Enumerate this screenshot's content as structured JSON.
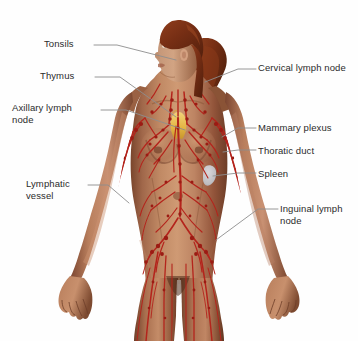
{
  "figure": {
    "background_color": "#fefefe",
    "width": 358,
    "height": 341
  },
  "palette": {
    "lymph_vessel": "#b4241c",
    "lymph_node": "#a01c14",
    "skin_light": "#c79madeup",
    "skin_mid": "#a9leavemadeup",
    "leader_line": "#8a8a8a",
    "label_text": "#2b2b2b",
    "hair": "#7d3218",
    "thymus": "#e0b23c",
    "spleen": "#c9ccd2"
  },
  "colors": {
    "lymph_vessel": "#b4241c",
    "lymph_node": "#991a12",
    "leader_line": "#8d8d8d",
    "label_text": "#2b2b2b",
    "hair_dark": "#6e2a14",
    "hair_mid": "#8a3a1c",
    "hair_light": "#a04a22",
    "skin_highlight": "#d8a88a",
    "skin_base": "#bd8463",
    "skin_mid": "#a96c4c",
    "skin_shadow": "#7d4a30",
    "skin_deep": "#5d3220",
    "thymus": "#e8bc4e",
    "spleen": "#c6c9d0",
    "background": "#fefefe"
  },
  "labels": [
    {
      "id": "tonsils",
      "text": "Tonsils",
      "side": "left",
      "text_x": 44,
      "text_y": 38,
      "leader": [
        [
          94,
          45
        ],
        [
          117,
          45
        ],
        [
          176,
          60
        ]
      ],
      "target": "palatine tonsil region of the throat"
    },
    {
      "id": "thymus",
      "text": "Thymus",
      "side": "left",
      "text_x": 40,
      "text_y": 70,
      "leader": [
        [
          95,
          77
        ],
        [
          120,
          77
        ],
        [
          176,
          117
        ]
      ],
      "target": "thymus gland behind the sternum"
    },
    {
      "id": "axillary-lymph-node",
      "text": "Axillary lymph\nnode",
      "side": "left",
      "text_x": 12,
      "text_y": 102,
      "leader": [
        [
          101,
          110
        ],
        [
          126,
          110
        ],
        [
          185,
          130
        ]
      ],
      "target": "armpit lymph node cluster"
    },
    {
      "id": "lymphatic-vessel",
      "text": "Lymphatic\nvessel",
      "side": "left",
      "text_x": 26,
      "text_y": 178,
      "leader": [
        [
          88,
          185
        ],
        [
          108,
          185
        ],
        [
          129,
          203
        ]
      ],
      "target": "lymphatic vessel along the left forearm"
    },
    {
      "id": "cervical-lymph-node",
      "text": "Cervical lymph node",
      "side": "right",
      "text_x": 258,
      "text_y": 62,
      "leader": [
        [
          256,
          69
        ],
        [
          238,
          69
        ],
        [
          205,
          82
        ]
      ],
      "target": "neck lymph node chain"
    },
    {
      "id": "mammary-plexus",
      "text": "Mammary plexus",
      "side": "right",
      "text_x": 258,
      "text_y": 122,
      "leader": [
        [
          256,
          128
        ],
        [
          238,
          128
        ],
        [
          222,
          137
        ]
      ],
      "target": "lymphatic plexus of the breast"
    },
    {
      "id": "thoratic-duct",
      "text": "Thoratic duct",
      "side": "right",
      "text_x": 258,
      "text_y": 145,
      "leader": [
        [
          256,
          150
        ],
        [
          238,
          150
        ],
        [
          223,
          152
        ]
      ],
      "target": "thoracic duct"
    },
    {
      "id": "spleen",
      "text": "Spleen",
      "side": "right",
      "text_x": 258,
      "text_y": 168,
      "leader": [
        [
          256,
          173
        ],
        [
          238,
          173
        ],
        [
          213,
          176
        ]
      ],
      "target": "spleen"
    },
    {
      "id": "inguinal-lymph-node",
      "text": "Inguinal lymph\nnode",
      "side": "right",
      "text_x": 280,
      "text_y": 203,
      "leader": [
        [
          278,
          209
        ],
        [
          258,
          209
        ],
        [
          216,
          240
        ]
      ],
      "target": "groin lymph node cluster"
    }
  ]
}
